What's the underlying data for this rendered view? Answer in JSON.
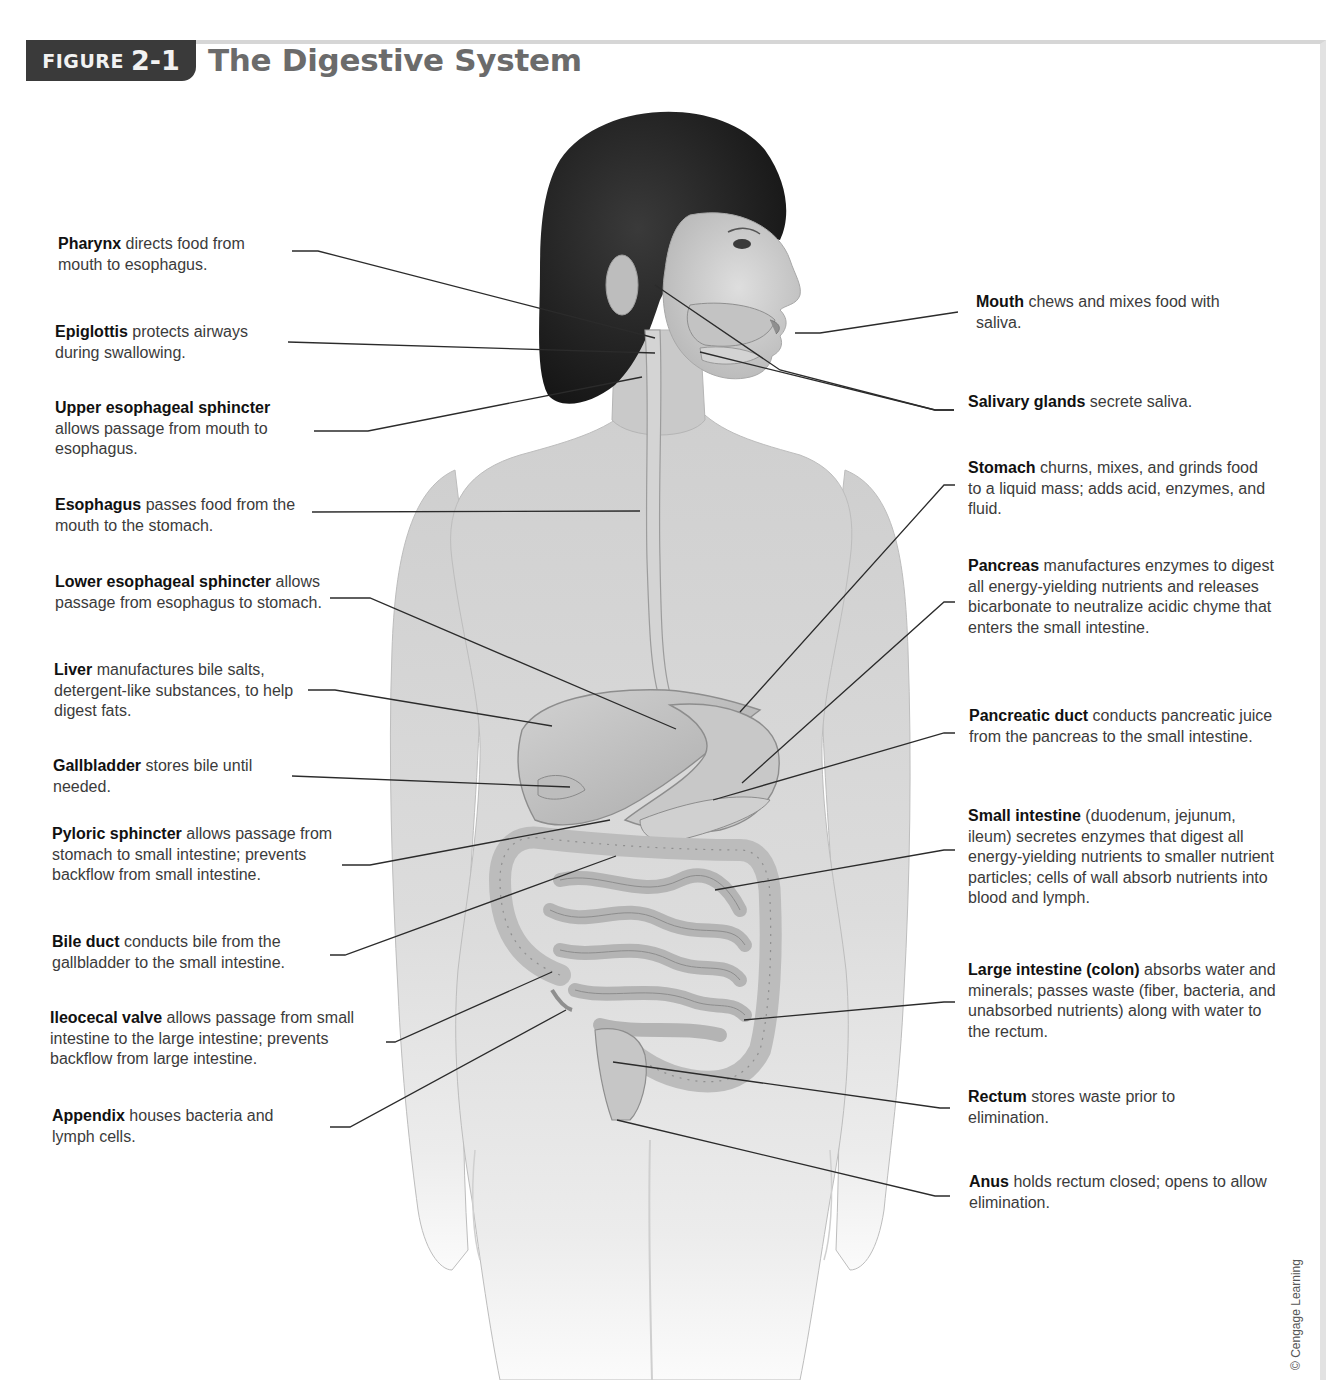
{
  "figure": {
    "badge_word": "FIGURE",
    "badge_number": "2-1",
    "title": "The Digestive System",
    "credit": "© Cengage Learning",
    "colors": {
      "badge_bg": "#3a3a3a",
      "title": "#6b6b6b",
      "leader_line": "#2b2b2b",
      "skin": "#d9d9d9",
      "hair": "#1e1e1e"
    }
  },
  "labels_left": [
    {
      "term": "Pharynx",
      "text": " directs food from mouth to esophagus."
    },
    {
      "term": "Epiglottis",
      "text": " protects airways during swallowing."
    },
    {
      "term": "Upper esophageal sphincter",
      "text": " allows passage from mouth to esophagus."
    },
    {
      "term": "Esophagus",
      "text": " passes food from the mouth to the stomach."
    },
    {
      "term": "Lower esophageal sphincter",
      "text": " allows passage from esophagus to stomach."
    },
    {
      "term": "Liver",
      "text": " manufactures bile salts, detergent-like substances, to help digest fats."
    },
    {
      "term": "Gallbladder",
      "text": " stores bile until needed."
    },
    {
      "term": "Pyloric sphincter",
      "text": " allows passage from stomach to small intestine; prevents backflow from small intestine."
    },
    {
      "term": "Bile duct",
      "text": " conducts bile from the gallbladder to the small intestine."
    },
    {
      "term": "Ileocecal valve",
      "text": " allows passage from small intestine to the large intestine; prevents backflow from large intestine."
    },
    {
      "term": "Appendix",
      "text": " houses bacteria and lymph cells."
    }
  ],
  "labels_right": [
    {
      "term": "Mouth",
      "text": " chews and mixes food with saliva."
    },
    {
      "term": "Salivary glands",
      "text": " secrete saliva."
    },
    {
      "term": "Stomach",
      "text": " churns, mixes, and grinds food to a liquid mass; adds acid, enzymes, and fluid."
    },
    {
      "term": "Pancreas",
      "text": " manufactures enzymes to digest all energy-yielding nutrients and releases bicarbonate to neutralize acidic chyme that enters the small intestine."
    },
    {
      "term": "Pancreatic duct",
      "text": " conducts pancreatic juice from the pancreas to the small intestine."
    },
    {
      "term": "Small intestine",
      "text": " (duodenum, jejunum, ileum) secretes enzymes that digest all energy-yielding nutrients to smaller nutrient particles; cells of wall absorb nutrients into blood and lymph."
    },
    {
      "term": "Large intestine (colon)",
      "text": " absorbs water and minerals; passes waste (fiber, bacteria, and unabsorbed nutrients) along with water to the rectum."
    },
    {
      "term": "Rectum",
      "text": " stores waste prior to elimination."
    },
    {
      "term": "Anus",
      "text": " holds rectum closed; opens to allow elimination."
    }
  ]
}
